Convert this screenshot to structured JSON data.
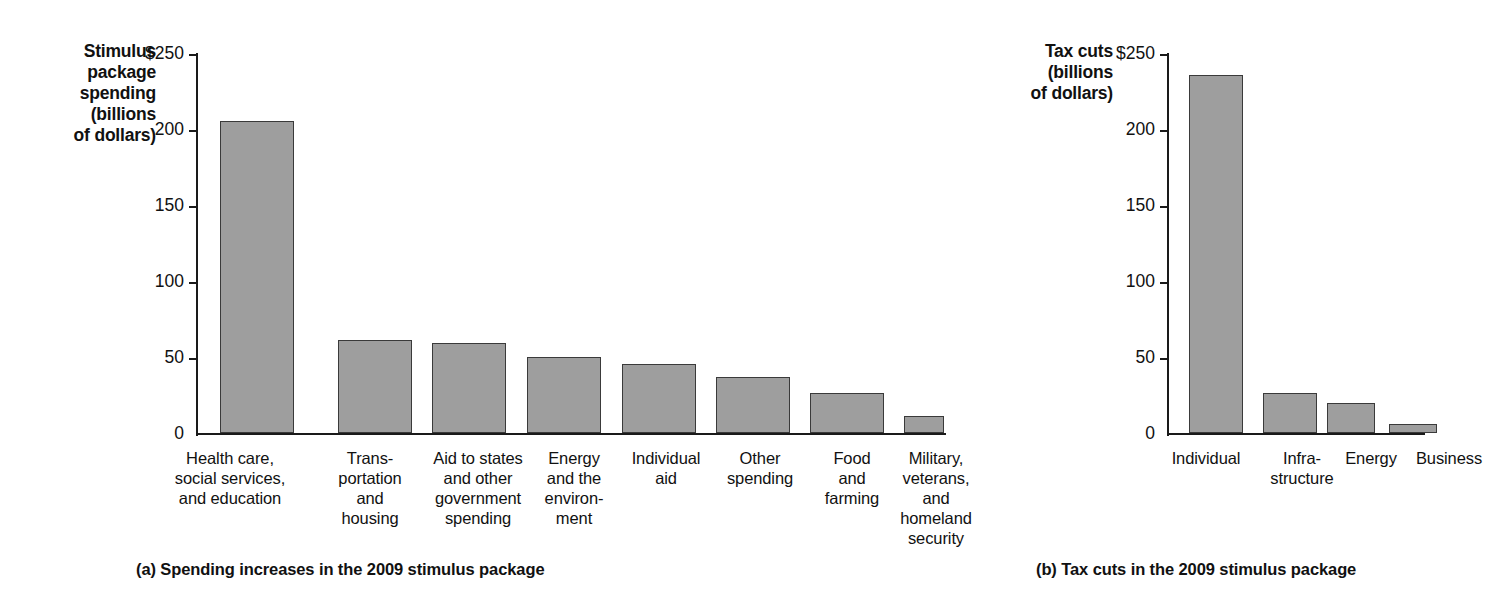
{
  "figure": {
    "panel_a": {
      "axis_title": "Stimulus\npackage\nspending\n(billions\nof dollars)",
      "caption": "(a) Spending increases in the 2009 stimulus package",
      "y_ticks": [
        "$250",
        "200",
        "150",
        "100",
        "50",
        "0"
      ],
      "categories": [
        "Health care,\nsocial services,\nand education",
        "Trans-\nportation\nand\nhousing",
        "Aid to states\nand other\ngovernment\nspending",
        "Energy\nand the\nenviron-\nment",
        "Individual\naid",
        "Other\nspending",
        "Food\nand\nfarming",
        "Military,\nveterans,\nand\nhomeland\nsecurity"
      ],
      "values": [
        205,
        61,
        59,
        50,
        45,
        37,
        26,
        11
      ]
    },
    "panel_b": {
      "axis_title": "Tax cuts\n(billions\nof dollars)",
      "caption": "(b) Tax cuts in the 2009 stimulus package",
      "y_ticks": [
        "$250",
        "200",
        "150",
        "100",
        "50",
        "0"
      ],
      "categories": [
        "Individual",
        "Infra-\nstructure",
        "Energy",
        "Business"
      ],
      "values": [
        235,
        26,
        20,
        6
      ]
    },
    "colors": {
      "bar_fill": "#9e9e9e",
      "bar_outline": "#3a3a3a",
      "axis": "#1a1a1a",
      "text": "#111111",
      "background": "#ffffff"
    }
  },
  "chart_data": [
    {
      "type": "bar",
      "title": "(a) Spending increases in the 2009 stimulus package",
      "xlabel": "",
      "ylabel": "Stimulus package spending (billions of dollars)",
      "ylim": [
        0,
        250
      ],
      "yticks": [
        0,
        50,
        100,
        150,
        200,
        250
      ],
      "ytick_labels": [
        "0",
        "50",
        "100",
        "150",
        "200",
        "$250"
      ],
      "grid": false,
      "legend": "none",
      "categories": [
        "Health care, social services, and education",
        "Transportation and housing",
        "Aid to states and other government spending",
        "Energy and the environment",
        "Individual aid",
        "Other spending",
        "Food and farming",
        "Military, veterans, and homeland security"
      ],
      "values": [
        205,
        61,
        59,
        50,
        45,
        37,
        26,
        11
      ],
      "units": "billions of dollars"
    },
    {
      "type": "bar",
      "title": "(b) Tax cuts in the 2009 stimulus package",
      "xlabel": "",
      "ylabel": "Tax cuts (billions of dollars)",
      "ylim": [
        0,
        250
      ],
      "yticks": [
        0,
        50,
        100,
        150,
        200,
        250
      ],
      "ytick_labels": [
        "0",
        "50",
        "100",
        "150",
        "200",
        "$250"
      ],
      "grid": false,
      "legend": "none",
      "categories": [
        "Individual",
        "Infrastructure",
        "Energy",
        "Business"
      ],
      "values": [
        235,
        26,
        20,
        6
      ],
      "units": "billions of dollars"
    }
  ]
}
